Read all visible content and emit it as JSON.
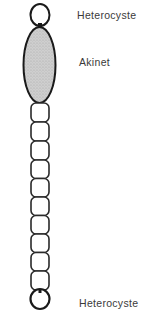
{
  "diagram": {
    "labels": {
      "top_heterocyst": "Heterocyste",
      "akinete": "Akinet",
      "bottom_heterocyst": "Heterocyste"
    },
    "structure": {
      "top": "heterocyst",
      "then": "akinete",
      "vegetative_cell_count": 10,
      "bottom": "heterocyst"
    },
    "colors": {
      "outline": "#1a1a1a",
      "akinete_fill": "#c9c9c9",
      "cell_fill": "#ffffff",
      "label_text": "#3a3a3a"
    }
  }
}
